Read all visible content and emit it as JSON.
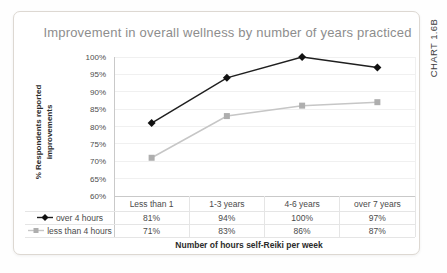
{
  "meta": {
    "chart_code": "CHART 1.6B"
  },
  "chart_data": {
    "type": "line",
    "title": "Improvement in overall wellness by number of years practiced",
    "ylabel": "% Respondents reported improvements",
    "xlabel": "Number of hours self-Reiki per week",
    "categories": [
      "Less than 1",
      "1-3 years",
      "4-6 years",
      "over 7 years"
    ],
    "series": [
      {
        "name": "over 4 hours",
        "values": [
          81,
          94,
          100,
          97
        ],
        "marker": "diamond",
        "line_color": "#1f1f1f",
        "marker_color": "#111111"
      },
      {
        "name": "less than 4 hours",
        "values": [
          71,
          83,
          86,
          87
        ],
        "marker": "square",
        "line_color": "#c6c6c6",
        "marker_color": "#aeaeae"
      }
    ],
    "ylim": [
      60,
      100
    ],
    "ytick_step": 5,
    "ytick_labels": [
      "100%",
      "95%",
      "90%",
      "85%",
      "80%",
      "75%",
      "70%",
      "65%",
      "60%"
    ],
    "value_suffix": "%",
    "grid": true,
    "legend_position": "left-of-data-table",
    "colors": {
      "grid_line": "#f0f0f0",
      "axis_line": "#c9c9c9",
      "table_line": "#e5e5e5",
      "title_text": "#8d8d8d"
    }
  }
}
